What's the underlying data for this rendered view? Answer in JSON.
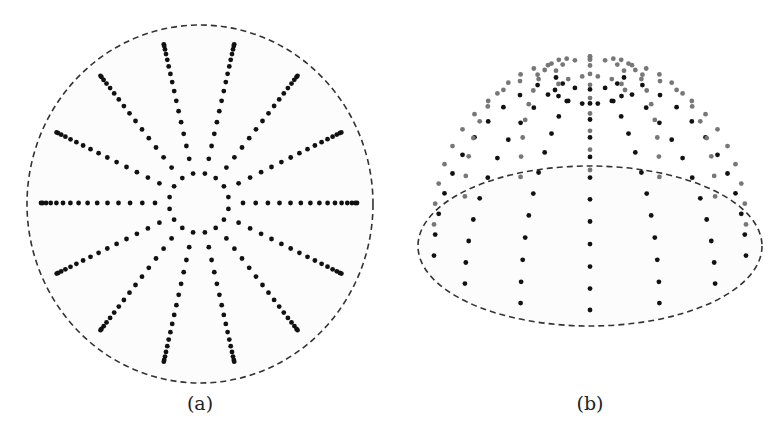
{
  "figure": {
    "panels": [
      {
        "id": "a",
        "caption": "(a)",
        "caption_pos": [
          200,
          392
        ],
        "view": "top",
        "boundary": {
          "cx": 200,
          "cy": 204,
          "rx": 173,
          "ry": 179,
          "style": "dashed",
          "color": "#333333"
        },
        "inner_ring": {
          "cx": 199,
          "cy": 203,
          "r": 30,
          "dots": 16
        },
        "spokes": {
          "count": 14,
          "start_angle_deg": -102.86,
          "inner_r": 44,
          "outer_r": 158,
          "dots_per_spoke": 15,
          "outer_compression": 0.6
        },
        "dot_color": "#111111",
        "dot_radius": 2.4
      },
      {
        "id": "b",
        "caption": "(b)",
        "caption_pos": [
          590,
          392
        ],
        "view": "perspective-dome",
        "base_ellipse": {
          "cx": 590,
          "cy": 246,
          "rx": 172,
          "ry": 80,
          "style": "dashed",
          "color": "#333333"
        },
        "apex_ring": {
          "cx": 590,
          "cy": 90,
          "rx": 35,
          "ry": 14,
          "dots": 14
        },
        "dome": {
          "cx": 590,
          "base_cy": 240,
          "rx": 160,
          "ry": 70,
          "height": 170,
          "meridians": 14,
          "dots_per_meridian": 12
        },
        "dot_color_front": "#111111",
        "dot_color_back": "#777777",
        "dot_radius": 2.4
      }
    ]
  }
}
